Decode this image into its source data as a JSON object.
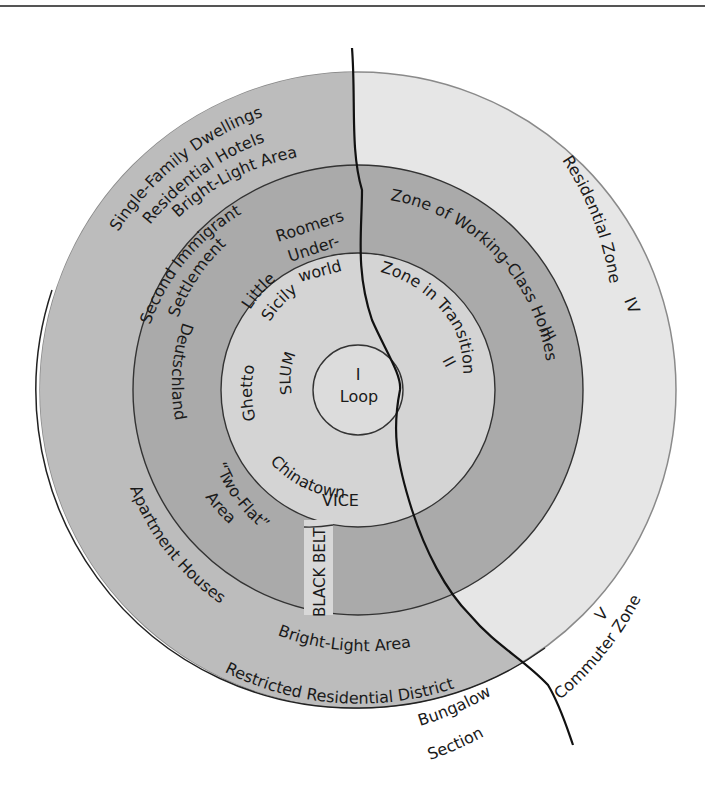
{
  "diagram": {
    "colors": {
      "zone_I": "#dcdcdc",
      "zone_II": "#d4d4d4",
      "zone_III": "#aaaaaa",
      "zone_IV_left": "#bcbcbc",
      "zone_IV_right": "#e6e6e6",
      "black_belt": "#d8d8d8",
      "river": "#111111",
      "ring_line": "#333333"
    },
    "zones": {
      "I": {
        "numeral": "I",
        "name": "Loop"
      },
      "II": {
        "numeral": "II",
        "name": "Zone in Transition"
      },
      "III": {
        "numeral": "III",
        "name": "Zone of Working-Class Homes"
      },
      "IV": {
        "numeral": "IV",
        "name": "Residential Zone"
      },
      "V": {
        "numeral": "V",
        "name": "Commuter Zone"
      }
    },
    "labels": {
      "single_family": "Single-Family Dwellings",
      "residential_hotels": "Residential Hotels",
      "bright_light_top": "Bright-Light Area",
      "second_immigrant": "Second Immigrant",
      "settlement": "Settlement",
      "roomers": "Roomers",
      "under": "Under-",
      "world": "world",
      "little": "Little",
      "sicily": "Sicily",
      "ghetto": "Ghetto",
      "slum": "SLUM",
      "chinatown": "Chinatown",
      "vice": "VICE",
      "deutschland": "Deutschland",
      "two_flat": "“Two-Flat”",
      "area": "Area",
      "black_belt": "BLACK BELT",
      "apartment_houses": "Apartment Houses",
      "bright_light_bottom": "Bright-Light Area",
      "restricted": "Restricted Residential District",
      "bungalow": "Bungalow",
      "section": "Section"
    }
  }
}
